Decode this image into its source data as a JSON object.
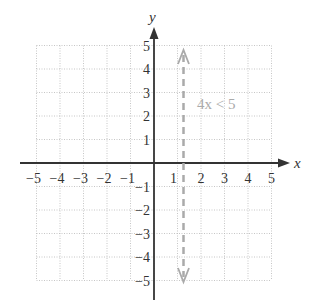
{
  "chart_data": {
    "type": "line",
    "title": "",
    "xlabel": "x",
    "ylabel": "y",
    "xlim": [
      -5,
      5
    ],
    "ylim": [
      -5,
      5
    ],
    "grid": true,
    "x_ticks": [
      "−5",
      "−4",
      "−3",
      "−2",
      "−1",
      "1",
      "2",
      "3",
      "4",
      "5"
    ],
    "y_ticks": [
      "5",
      "4",
      "3",
      "2",
      "1",
      "−1",
      "−2",
      "−3",
      "−4",
      "−5"
    ],
    "series": [
      {
        "name": "4x < 5",
        "type": "vertical-dashed-boundary",
        "x": 1.25,
        "y_range": [
          -5,
          5
        ],
        "style": "dashed",
        "color": "#aaaaaa"
      }
    ],
    "annotations": [
      {
        "text": "4x < 5",
        "x": 1.6,
        "y": 2
      }
    ]
  },
  "colors": {
    "axis": "#333333",
    "grid": "#b8b8b8",
    "boundary": "#aaaaaa"
  }
}
